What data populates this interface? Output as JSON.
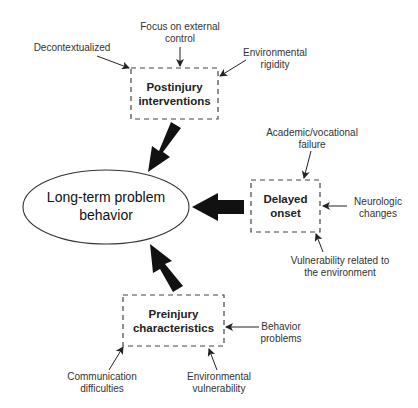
{
  "diagram": {
    "center": {
      "lines": [
        "Long-term problem",
        "behavior"
      ]
    },
    "nodes": {
      "postinjury": {
        "lines": [
          "Postinjury",
          "interventions"
        ],
        "factors": {
          "decontextualized": {
            "lines": [
              "Decontextualized"
            ]
          },
          "external_control": {
            "lines": [
              "Focus on external",
              "control"
            ]
          },
          "environmental_rigidity": {
            "lines": [
              "Environmental",
              "rigidity"
            ]
          }
        }
      },
      "delayed_onset": {
        "lines": [
          "Delayed",
          "onset"
        ],
        "factors": {
          "academic_failure": {
            "lines": [
              "Academic/vocational",
              "failure"
            ]
          },
          "neurologic_changes": {
            "lines": [
              "Neurologic",
              "changes"
            ]
          },
          "environment_vulnerability": {
            "lines": [
              "Vulnerability related to",
              "the environment"
            ]
          }
        }
      },
      "preinjury": {
        "lines": [
          "Preinjury",
          "characteristics"
        ],
        "factors": {
          "behavior_problems": {
            "lines": [
              "Behavior",
              "problems"
            ]
          },
          "communication": {
            "lines": [
              "Communication",
              "difficulties"
            ]
          },
          "environmental_vulnerability": {
            "lines": [
              "Environmental",
              "vulnerability"
            ]
          }
        }
      }
    },
    "colors": {
      "arrow": "#111111",
      "border": "#444444",
      "text": "#333333"
    }
  }
}
